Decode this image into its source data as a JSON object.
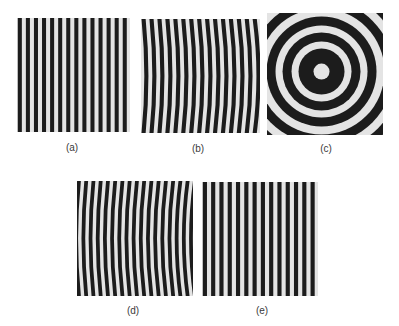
{
  "figure": {
    "panels": [
      {
        "id": "a",
        "label": "(a)",
        "pattern": "straight-vertical-fringes",
        "x": 17,
        "y": 18,
        "w": 113,
        "h": 114,
        "label_x": 72,
        "label_y": 143,
        "stripes": 14
      },
      {
        "id": "b",
        "label": "(b)",
        "pattern": "curved-fringes-left",
        "x": 141,
        "y": 19,
        "w": 119,
        "h": 114,
        "label_x": 198,
        "label_y": 144,
        "stripes": 17
      },
      {
        "id": "c",
        "label": "(c)",
        "pattern": "concentric-rings",
        "x": 267,
        "y": 13,
        "w": 116,
        "h": 122,
        "label_x": 326,
        "label_y": 144,
        "rings": 6
      },
      {
        "id": "d",
        "label": "(d)",
        "pattern": "curved-fringes-right",
        "x": 77,
        "y": 181,
        "w": 116,
        "h": 115,
        "label_x": 133,
        "label_y": 306,
        "stripes": 18
      },
      {
        "id": "e",
        "label": "(e)",
        "pattern": "straight-vertical-fringes",
        "x": 202,
        "y": 182,
        "w": 116,
        "h": 114,
        "label_x": 262,
        "label_y": 306,
        "stripes": 14
      }
    ],
    "colors": {
      "dark": "#1c1c1c",
      "light": "#e4e4e4",
      "label": "#3a3a3a"
    }
  }
}
